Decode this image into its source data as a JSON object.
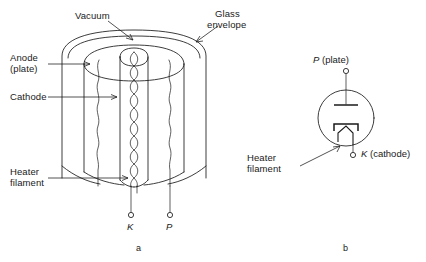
{
  "figure": {
    "line_color": "#1a1a1a",
    "background": "#ffffff"
  },
  "panel_a": {
    "caption": "a",
    "labels": {
      "vacuum": "Vacuum",
      "glass_envelope_line1": "Glass",
      "glass_envelope_line2": "envelope",
      "anode_line1": "Anode",
      "anode_line2": "(plate)",
      "cathode": "Cathode",
      "heater_line1": "Heater",
      "heater_line2": "filament"
    },
    "terminals": [
      {
        "id": "K",
        "label": "K"
      },
      {
        "id": "P",
        "label": "P"
      }
    ]
  },
  "panel_b": {
    "caption": "b",
    "labels": {
      "plate_symbol": "P",
      "plate_text": " (plate)",
      "cathode_symbol": "K",
      "cathode_text": " (cathode)",
      "heater_line1": "Heater",
      "heater_line2": "filament"
    }
  }
}
